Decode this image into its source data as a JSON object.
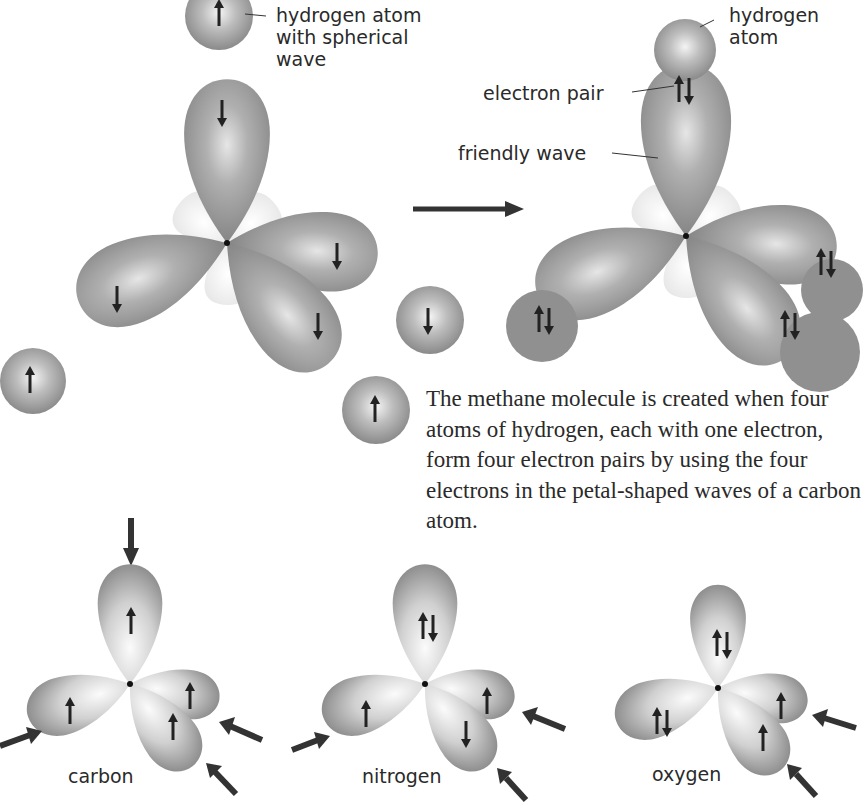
{
  "labels": {
    "hydrogen_spherical": "hydrogen atom\nwith spherical\nwave",
    "hydrogen_atom": "hydrogen\natom",
    "electron_pair": "electron pair",
    "friendly_wave": "friendly wave"
  },
  "caption": "The methane molecule is created when four atoms of hydrogen, each with one electron, form four electron pairs by using the four electrons in the petal-shaped waves of a carbon atom.",
  "elements": [
    {
      "name": "carbon",
      "top_lobe": "up",
      "left_lobe": "up",
      "right_back_lobe": "up",
      "right_front_lobe": "up"
    },
    {
      "name": "nitrogen",
      "top_lobe": "pair",
      "left_lobe": "up",
      "right_back_lobe": "up",
      "right_front_lobe": "down"
    },
    {
      "name": "oxygen",
      "top_lobe": "pair",
      "left_lobe": "pair",
      "right_back_lobe": "up",
      "right_front_lobe": "up"
    }
  ],
  "colors": {
    "lobe_dark": "#8c8c8c",
    "lobe_light": "#f2f2f2",
    "arrow": "#222222",
    "text": "#2a2a2a"
  }
}
